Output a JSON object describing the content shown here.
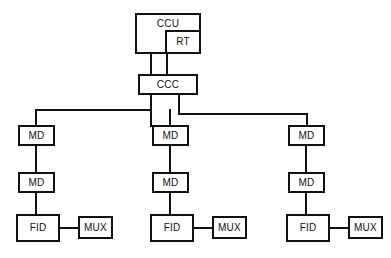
{
  "diagram": {
    "background_color": "#ffffff",
    "line_color": "#111111",
    "box_fill_color": "#ffffff",
    "nodes": {
      "ccu": "CCU",
      "rt": "RT",
      "ccc": "CCC",
      "branches": [
        {
          "md_upper": "MD",
          "md_lower": "MD",
          "fid": "FID",
          "mux": "MUX"
        },
        {
          "md_upper": "MD",
          "md_lower": "MD",
          "fid": "FID",
          "mux": "MUX"
        },
        {
          "md_upper": "MD",
          "md_lower": "MD",
          "fid": "FID",
          "mux": "MUX"
        }
      ]
    }
  }
}
